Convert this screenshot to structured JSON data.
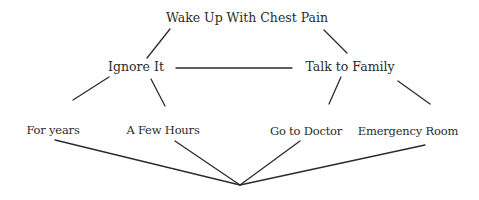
{
  "diagram": {
    "type": "decision-tree",
    "line_color": "#2b2b2b",
    "text_color": "#2b2b2b",
    "nodes": {
      "root": {
        "label": "Wake Up With Chest Pain",
        "x": 247,
        "y": 18
      },
      "ignore": {
        "label": "Ignore It",
        "x": 136,
        "y": 67
      },
      "talk": {
        "label": "Talk to Family",
        "x": 350,
        "y": 67
      },
      "years": {
        "label": "For years",
        "x": 53,
        "y": 130
      },
      "hours": {
        "label": "A Few Hours",
        "x": 163,
        "y": 130
      },
      "doctor": {
        "label": "Go to Doctor",
        "x": 306,
        "y": 131
      },
      "er": {
        "label": "Emergency Room",
        "x": 408,
        "y": 131
      }
    },
    "edges": [
      {
        "from": "root",
        "to": "ignore"
      },
      {
        "from": "root",
        "to": "talk"
      },
      {
        "from": "ignore",
        "to": "talk"
      },
      {
        "from": "ignore",
        "to": "years"
      },
      {
        "from": "ignore",
        "to": "hours"
      },
      {
        "from": "talk",
        "to": "doctor"
      },
      {
        "from": "talk",
        "to": "er"
      },
      {
        "from": "years",
        "to": "convergence-point"
      },
      {
        "from": "hours",
        "to": "convergence-point"
      },
      {
        "from": "doctor",
        "to": "convergence-point"
      },
      {
        "from": "er",
        "to": "convergence-point"
      }
    ]
  }
}
